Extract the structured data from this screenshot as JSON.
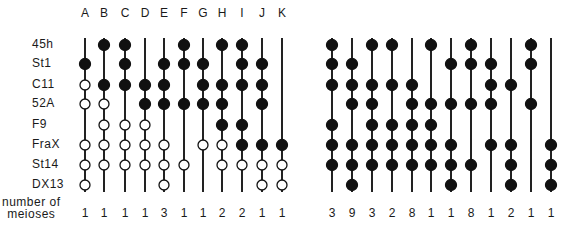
{
  "figure": {
    "type": "haplotype-recombination-diagram",
    "markers": [
      "45h",
      "St1",
      "C11",
      "52A",
      "F9",
      "FraX",
      "St14",
      "DX13"
    ],
    "meioses_label_line1": "number of",
    "meioses_label_line2": "meioses",
    "colors": {
      "filled": "#111111",
      "line": "#222222",
      "open_fill": "#ffffff"
    },
    "legend": {
      "filled": "filled circle",
      "open": "open circle",
      "none": "no circle (line only)"
    },
    "left_panel": {
      "columns": [
        {
          "label": "A",
          "meioses": "1",
          "alleles": [
            "-",
            "F",
            "O",
            "O",
            "-",
            "O",
            "O",
            "O"
          ]
        },
        {
          "label": "B",
          "meioses": "1",
          "alleles": [
            "F",
            "-",
            "F",
            "O",
            "O",
            "O",
            "O",
            "-"
          ]
        },
        {
          "label": "C",
          "meioses": "1",
          "alleles": [
            "F",
            "F",
            "F",
            "-",
            "O",
            "O",
            "O",
            "-"
          ]
        },
        {
          "label": "D",
          "meioses": "1",
          "alleles": [
            "-",
            "-",
            "F",
            "F",
            "O",
            "O",
            "O",
            "-"
          ]
        },
        {
          "label": "E",
          "meioses": "3",
          "alleles": [
            "-",
            "F",
            "F",
            "F",
            "-",
            "O",
            "O",
            "O"
          ]
        },
        {
          "label": "F",
          "meioses": "1",
          "alleles": [
            "F",
            "F",
            "-",
            "F",
            "-",
            "-",
            "O",
            "-"
          ]
        },
        {
          "label": "G",
          "meioses": "1",
          "alleles": [
            "-",
            "F",
            "F",
            "F",
            "-",
            "O",
            "-",
            "-"
          ]
        },
        {
          "label": "H",
          "meioses": "2",
          "alleles": [
            "F",
            "-",
            "F",
            "F",
            "F",
            "O",
            "O",
            "-"
          ]
        },
        {
          "label": "I",
          "meioses": "2",
          "alleles": [
            "F",
            "F",
            "F",
            "-",
            "F",
            "F",
            "O",
            "-"
          ]
        },
        {
          "label": "J",
          "meioses": "1",
          "alleles": [
            "-",
            "F",
            "F",
            "F",
            "-",
            "F",
            "O",
            "O"
          ]
        },
        {
          "label": "K",
          "meioses": "1",
          "alleles": [
            "-",
            "-",
            "-",
            "-",
            "-",
            "F",
            "O",
            "O"
          ]
        }
      ]
    },
    "right_panel": {
      "columns": [
        {
          "meioses": "3",
          "alleles": [
            "F",
            "F",
            "F",
            "-",
            "F",
            "F",
            "F",
            "-"
          ]
        },
        {
          "meioses": "9",
          "alleles": [
            "-",
            "F",
            "F",
            "F",
            "-",
            "F",
            "F",
            "F"
          ]
        },
        {
          "meioses": "3",
          "alleles": [
            "F",
            "-",
            "F",
            "F",
            "F",
            "F",
            "F",
            "-"
          ]
        },
        {
          "meioses": "2",
          "alleles": [
            "F",
            "-",
            "F",
            "-",
            "F",
            "F",
            "F",
            "-"
          ]
        },
        {
          "meioses": "8",
          "alleles": [
            "-",
            "-",
            "F",
            "F",
            "F",
            "F",
            "F",
            "-"
          ]
        },
        {
          "meioses": "1",
          "alleles": [
            "F",
            "-",
            "-",
            "F",
            "F",
            "F",
            "F",
            "-"
          ]
        },
        {
          "meioses": "1",
          "alleles": [
            "-",
            "F",
            "-",
            "F",
            "-",
            "F",
            "F",
            "F"
          ]
        },
        {
          "meioses": "8",
          "alleles": [
            "F",
            "F",
            "-",
            "F",
            "-",
            "-",
            "F",
            "-"
          ]
        },
        {
          "meioses": "1",
          "alleles": [
            "-",
            "F",
            "F",
            "F",
            "-",
            "F",
            "-",
            "-"
          ]
        },
        {
          "meioses": "2",
          "alleles": [
            "-",
            "-",
            "F",
            "-",
            "-",
            "F",
            "F",
            "F"
          ]
        },
        {
          "meioses": "1",
          "alleles": [
            "F",
            "F",
            "-",
            "F",
            "-",
            "-",
            "-",
            "-"
          ]
        },
        {
          "meioses": "1",
          "alleles": [
            "-",
            "-",
            "-",
            "-",
            "-",
            "F",
            "F",
            "F"
          ]
        }
      ]
    }
  }
}
